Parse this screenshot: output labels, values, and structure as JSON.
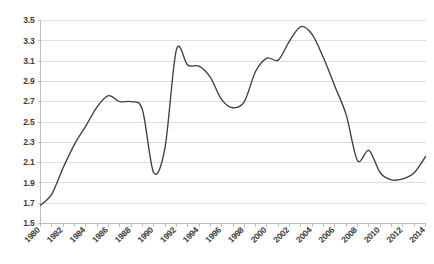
{
  "chart_data": {
    "type": "line",
    "title": "",
    "subtitle": "",
    "xlabel": "",
    "ylabel": "",
    "xlim": [
      1980,
      2014
    ],
    "ylim": [
      1.5,
      3.5
    ],
    "grid": true,
    "legend": false,
    "legend_position": "none",
    "line_color": "#3f3f3f",
    "gridline_color": "#d4d4d4",
    "axis_color": "#b8b8b8",
    "background_color": "#ffffff",
    "y_ticks": [
      "3.5",
      "3.3",
      "3.1",
      "2.9",
      "2.7",
      "2.5",
      "2.3",
      "2.1",
      "1.9",
      "1.7",
      "1.5"
    ],
    "y_tick_values": [
      3.5,
      3.3,
      3.1,
      2.9,
      2.7,
      2.5,
      2.3,
      2.1,
      1.9,
      1.7,
      1.5
    ],
    "x_ticks": [
      "1980",
      "1982",
      "1984",
      "1986",
      "1988",
      "1990",
      "1992",
      "1994",
      "1996",
      "1998",
      "2000",
      "2002",
      "2004",
      "2006",
      "2008",
      "2010",
      "2012",
      "2014"
    ],
    "x_tick_values": [
      1980,
      1982,
      1984,
      1986,
      1988,
      1990,
      1992,
      1994,
      1996,
      1998,
      2000,
      2002,
      2004,
      2006,
      2008,
      2010,
      2012,
      2014
    ],
    "x_tick_label_rotation": -45,
    "x_minor_tick_interval": 1,
    "series": [
      {
        "name": "series-1",
        "color": "#3f3f3f",
        "x": [
          1980,
          1981,
          1982,
          1983,
          1984,
          1985,
          1986,
          1987,
          1988,
          1989,
          1990,
          1991,
          1992,
          1993,
          1994,
          1995,
          1996,
          1997,
          1998,
          1999,
          2000,
          2001,
          2002,
          2003,
          2004,
          2005,
          2006,
          2007,
          2008,
          2009,
          2010,
          2011,
          2012,
          2013,
          2014
        ],
        "values": [
          1.68,
          1.79,
          2.05,
          2.28,
          2.46,
          2.65,
          2.76,
          2.7,
          2.7,
          2.62,
          2.0,
          2.25,
          3.21,
          3.06,
          3.05,
          2.94,
          2.72,
          2.64,
          2.7,
          3.0,
          3.13,
          3.11,
          3.3,
          3.44,
          3.36,
          3.13,
          2.85,
          2.57,
          2.12,
          2.22,
          2.0,
          1.93,
          1.94,
          2.0,
          2.16
        ]
      }
    ]
  }
}
